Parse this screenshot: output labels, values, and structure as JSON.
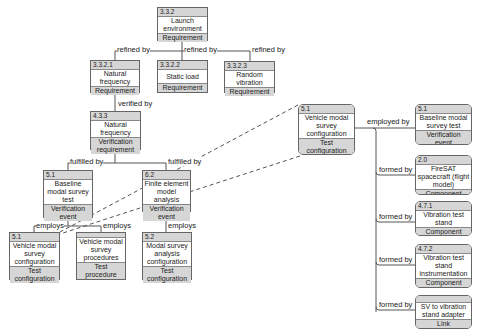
{
  "nodes": {
    "launch_env": {
      "id": "3.3.2",
      "name": "Launch environment",
      "type": "Requirement"
    },
    "natural_freq_req": {
      "id": "3.3.2.1",
      "name": "Natural frequency",
      "type": "Requirement"
    },
    "static_load": {
      "id": "3.3.2.2",
      "name": "Static load",
      "type": "Requirement"
    },
    "random_vib": {
      "id": "3.3.2.3",
      "name": "Random vibration",
      "type": "Requirement"
    },
    "natural_freq_ver": {
      "id": "4.3.3",
      "name": "Natural frequency",
      "type": "Verification requirement"
    },
    "baseline_test": {
      "id": "5.1",
      "name": "Baseline modal survey test",
      "type": "Verification event"
    },
    "fem_analysis": {
      "id": "6.2",
      "name": "Finite element model analysis",
      "type": "Verification event"
    },
    "vehicle_config": {
      "id": "5.1",
      "name": "Vehicle modal survey configuration",
      "type": "Test configuration"
    },
    "vehicle_procedures": {
      "id": "",
      "name": "Vehicle modal survey procedures",
      "type": "Test procedure"
    },
    "modal_analysis_config": {
      "id": "5.2",
      "name": "Modal survey analysis configuration",
      "type": "Test configuration"
    },
    "detail_vehicle_config": {
      "id": "5.1",
      "name": "Vehicle modal survey configuration",
      "type": "Test configuration"
    },
    "detail_baseline": {
      "id": "5.1",
      "name": "Baseline modal survey test",
      "type": "Verification event"
    },
    "firesat": {
      "id": "2.0",
      "name": "FireSAT spacecraft (flight model)",
      "type": "Component"
    },
    "vib_stand": {
      "id": "4.7.1",
      "name": "Vibration test stand",
      "type": "Component"
    },
    "vib_instr": {
      "id": "4.7.2",
      "name": "Vibration test stand instrumentation",
      "type": "Component"
    },
    "adapter": {
      "id": "",
      "name": "SV to vibration stand adapter",
      "type": "Link"
    }
  },
  "relations": {
    "refined_by": "refined by",
    "verified_by": "verified by",
    "fulfilled_by": "fulfilled by",
    "employs": "employs",
    "employed_by": "employed by",
    "formed_by": "formed by"
  },
  "colors": {
    "header_fill": "#d6d6d6",
    "border": "#666666",
    "line": "#555555"
  }
}
